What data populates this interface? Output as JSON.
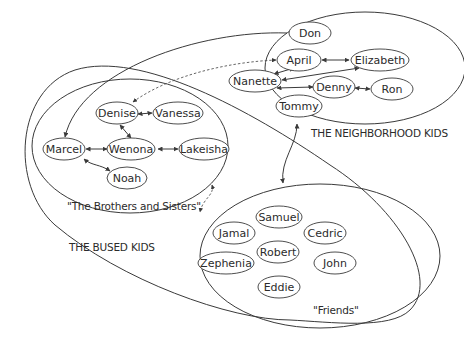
{
  "diagram": {
    "type": "social network / grouping diagram",
    "colors": {
      "stroke": "#3a3a3a",
      "text": "#2b2b2b",
      "background": "#ffffff"
    },
    "groups": [
      {
        "id": "neighborhood",
        "label": "THE NEIGHBORHOOD KIDS"
      },
      {
        "id": "brothers",
        "label": "\"The Brothers and Sisters\""
      },
      {
        "id": "friends",
        "label": "\"Friends\""
      },
      {
        "id": "bused",
        "label": "THE BUSED KIDS"
      }
    ],
    "nodes": {
      "don": "Don",
      "april": "April",
      "elizabeth": "Elizabeth",
      "nanette": "Nanette",
      "denny": "Denny",
      "ron": "Ron",
      "tommy": "Tommy",
      "denise": "Denise",
      "vanessa": "Vanessa",
      "marcel": "Marcel",
      "wenona": "Wenona",
      "lakeisha": "Lakeisha",
      "noah": "Noah",
      "samuel": "Samuel",
      "jamal": "Jamal",
      "cedric": "Cedric",
      "robert": "Robert",
      "zephenia": "Zephenia",
      "john": "John",
      "eddie": "Eddie"
    },
    "edges": [
      {
        "from": "Don",
        "to": "Marcel",
        "style": "solid",
        "direction": "one-way"
      },
      {
        "from": "Denise",
        "to": "April",
        "style": "dashed",
        "direction": "two-way"
      },
      {
        "from": "April",
        "to": "Elizabeth",
        "style": "solid",
        "direction": "two-way"
      },
      {
        "from": "April",
        "to": "Nanette",
        "style": "solid",
        "direction": "two-way"
      },
      {
        "from": "Nanette",
        "to": "Elizabeth",
        "style": "solid",
        "direction": "two-way"
      },
      {
        "from": "Nanette",
        "to": "Denny",
        "style": "solid",
        "direction": "two-way"
      },
      {
        "from": "Denny",
        "to": "Ron",
        "style": "solid",
        "direction": "two-way"
      },
      {
        "from": "Denise",
        "to": "Vanessa",
        "style": "solid",
        "direction": "two-way"
      },
      {
        "from": "Denise",
        "to": "Wenona",
        "style": "solid",
        "direction": "two-way"
      },
      {
        "from": "Marcel",
        "to": "Wenona",
        "style": "solid",
        "direction": "two-way"
      },
      {
        "from": "Wenona",
        "to": "Lakeisha",
        "style": "solid",
        "direction": "two-way"
      },
      {
        "from": "Marcel",
        "to": "Noah",
        "style": "solid",
        "direction": "two-way"
      },
      {
        "from": "The Neighborhood Kids",
        "to": "Friends",
        "style": "solid",
        "direction": "two-way"
      },
      {
        "from": "The Brothers and Sisters",
        "to": "Friends",
        "style": "dashed",
        "direction": "two-way"
      }
    ]
  }
}
